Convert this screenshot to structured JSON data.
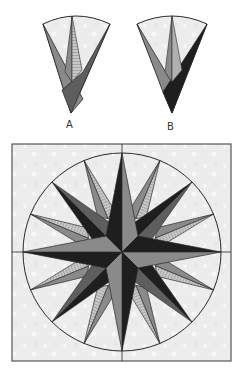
{
  "diagram": {
    "wedges": [
      {
        "id": "A",
        "label": "A"
      },
      {
        "id": "B",
        "label": "B"
      }
    ],
    "colors": {
      "background": "#efefef",
      "light": "#d9d9d9",
      "mid": "#8a8a8a",
      "dark_mid": "#5e5e5e",
      "darkest": "#1e1e1e",
      "stripe": "#b8b8b8",
      "line": "#2a2a2a"
    },
    "compass": {
      "points_main": 4,
      "points_secondary": 4,
      "points_tertiary": 8,
      "total_points": 16
    }
  }
}
